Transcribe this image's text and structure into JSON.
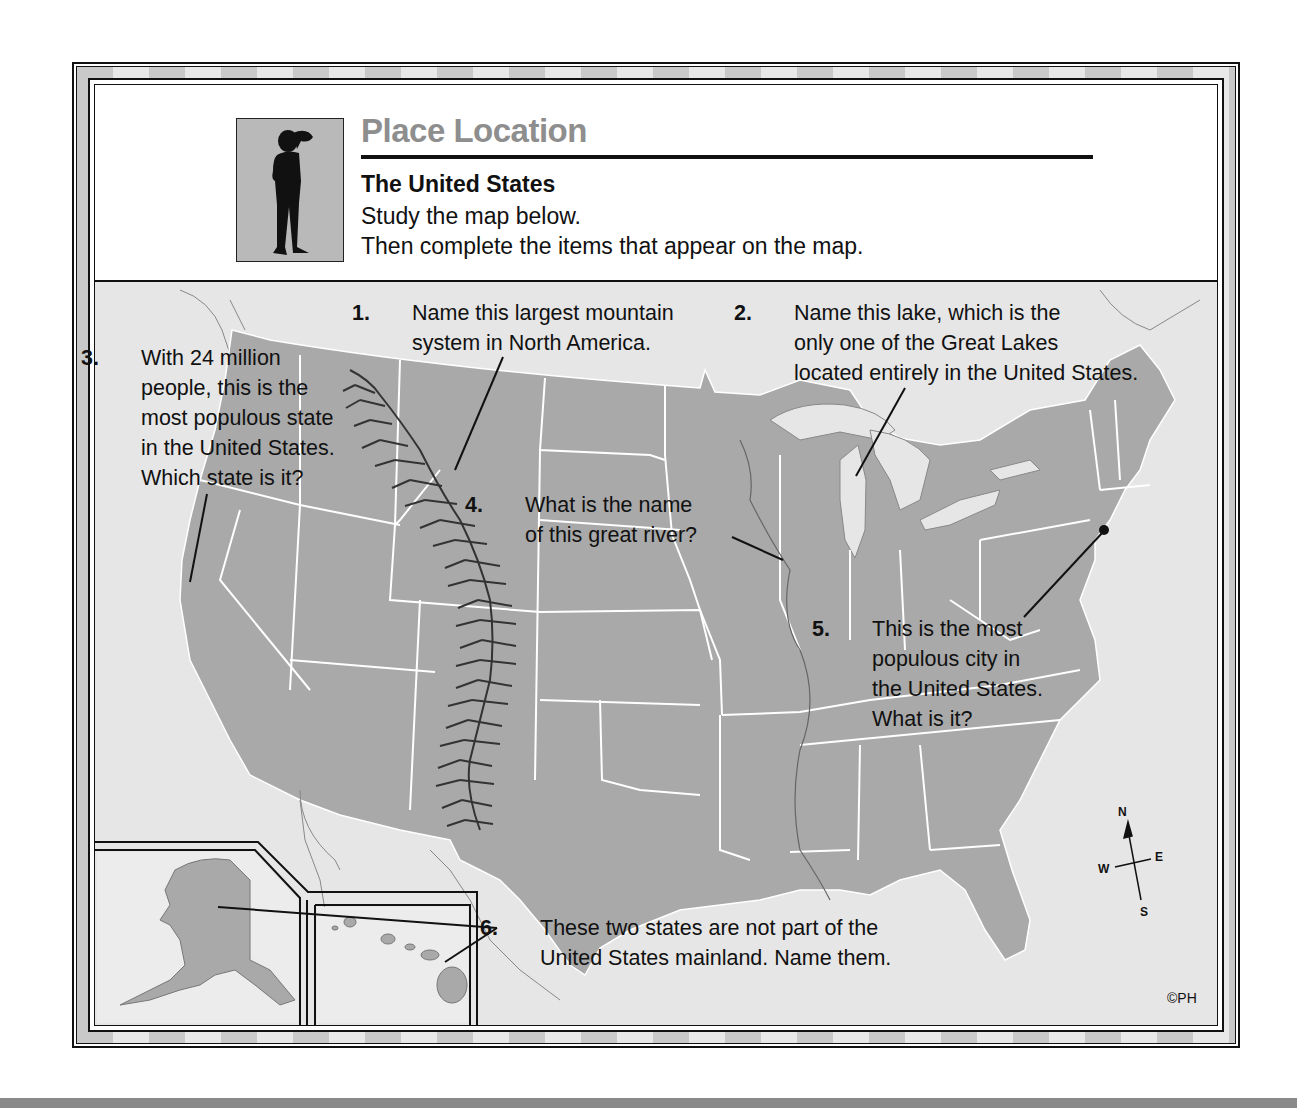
{
  "header": {
    "title": "Place Location",
    "subtitle": "The United States",
    "instructions": [
      "Study the map below.",
      "Then complete the items that appear on the map."
    ],
    "icon": "person-looking-icon"
  },
  "questions": [
    {
      "num": "1.",
      "lines": [
        "Name this largest mountain",
        "system in North America."
      ]
    },
    {
      "num": "2.",
      "lines": [
        "Name this lake, which is the",
        "only one of the Great Lakes",
        "located entirely in the United States."
      ]
    },
    {
      "num": "3.",
      "lines": [
        "With 24 million",
        "people, this is the",
        "most populous state",
        "in the United States.",
        "Which state is it?"
      ]
    },
    {
      "num": "4.",
      "lines": [
        "What is the name",
        "of this great river?"
      ]
    },
    {
      "num": "5.",
      "lines": [
        "This is the most",
        "populous city in",
        "the United States.",
        "What is it?"
      ]
    },
    {
      "num": "6.",
      "lines": [
        "These two states are not part of the",
        "United States mainland.  Name them."
      ]
    }
  ],
  "compass": {
    "n": "N",
    "s": "S",
    "e": "E",
    "w": "W"
  },
  "copyright": "©PH",
  "colors": {
    "land": "#a9a9a9",
    "water": "#e6e6e6",
    "border": "#ffffff",
    "title": "#8e8e8e"
  }
}
